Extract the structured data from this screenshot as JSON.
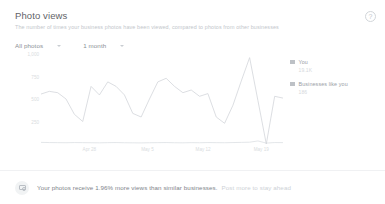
{
  "header": {
    "title": "Photo views",
    "subtitle": "The number of times your business photos have been viewed, compared to photos from other businesses",
    "help_icon": "help-question-icon"
  },
  "filters": [
    {
      "name": "photo-scope",
      "label": "All photos",
      "caret": "chevron-down-icon"
    },
    {
      "name": "time-range",
      "label": "1 month",
      "caret": "chevron-down-icon"
    }
  ],
  "legend": {
    "position": "right",
    "items": [
      {
        "label": "You",
        "value": "19.1K",
        "color": "#bdc1c6"
      },
      {
        "label": "Businesses like you",
        "value": "186",
        "color": "#bdc1c6"
      }
    ]
  },
  "footer": {
    "badge_icon": "camera-icon",
    "text": "Your photos receive 1.96% more views than similar businesses.",
    "link": "Post more to stay ahead"
  },
  "chart_data": {
    "type": "line",
    "title": "Photo views",
    "xlabel": "",
    "ylabel": "",
    "ylim": [
      0,
      1000
    ],
    "yticks": [
      1000,
      750,
      500,
      250
    ],
    "ytick_labels": [
      "1,000",
      "750",
      "500",
      "250"
    ],
    "grid": false,
    "x": [
      "Apr 22",
      "Apr 23",
      "Apr 24",
      "Apr 25",
      "Apr 26",
      "Apr 27",
      "Apr 28",
      "Apr 29",
      "Apr 30",
      "May 1",
      "May 2",
      "May 3",
      "May 4",
      "May 5",
      "May 6",
      "May 7",
      "May 8",
      "May 9",
      "May 10",
      "May 11",
      "May 12",
      "May 13",
      "May 14",
      "May 15",
      "May 16",
      "May 17",
      "May 18",
      "May 19",
      "May 20",
      "May 21"
    ],
    "xticks": [
      "Apr 28",
      "May 5",
      "May 12",
      "May 19"
    ],
    "xtick_positions": [
      0.2,
      0.44,
      0.67,
      0.91
    ],
    "series": [
      {
        "name": "You",
        "color": "#d3d6da",
        "values": [
          555,
          585,
          570,
          500,
          330,
          250,
          640,
          545,
          690,
          640,
          545,
          340,
          300,
          500,
          690,
          730,
          640,
          570,
          600,
          530,
          560,
          300,
          230,
          430,
          700,
          960,
          480,
          0,
          530,
          510
        ]
      },
      {
        "name": "Businesses like you",
        "color": "#dcdfe3",
        "values": [
          18,
          16,
          15,
          14,
          16,
          15,
          14,
          13,
          15,
          16,
          14,
          13,
          12,
          14,
          15,
          16,
          14,
          13,
          15,
          14,
          16,
          15,
          14,
          16,
          18,
          20,
          34,
          10,
          16,
          15
        ]
      }
    ]
  }
}
